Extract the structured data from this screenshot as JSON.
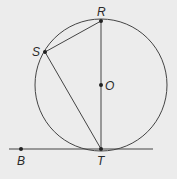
{
  "diagram": {
    "background": "#ececec",
    "stroke": "#444444",
    "circle": {
      "center": "O",
      "cx": 101,
      "cy": 85,
      "r": 66
    },
    "points": {
      "R": {
        "x": 101,
        "y": 21,
        "label": "R"
      },
      "S": {
        "x": 45,
        "y": 52,
        "label": "S"
      },
      "O": {
        "x": 101,
        "y": 85,
        "label": "O"
      },
      "T": {
        "x": 101,
        "y": 149,
        "label": "T"
      },
      "B": {
        "x": 21,
        "y": 149,
        "label": "B"
      }
    },
    "segments": [
      "RT",
      "SR",
      "ST"
    ],
    "tangent_line": {
      "through": [
        "B",
        "T"
      ],
      "x1": 9,
      "x2": 153,
      "y": 149
    }
  }
}
